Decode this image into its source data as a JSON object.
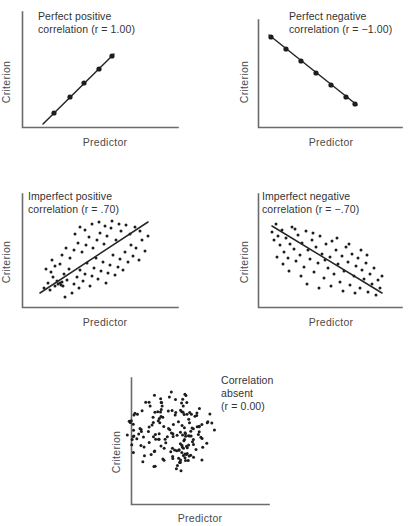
{
  "figure": {
    "background": "#ffffff",
    "ink_color": "#1d1d1d",
    "axis_color": "#6b6b6b",
    "width": 410,
    "height": 526
  },
  "chart_data": {
    "type": "scatter",
    "title": "",
    "panel_count": 5,
    "shared_axis_labels": {
      "xlabel": "Predictor",
      "ylabel": "Criterion"
    },
    "panels": [
      {
        "id": "perfect-positive",
        "caption": "Perfect positive\ncorrelation (r = 1.00)",
        "caption_line1": "Perfect positive",
        "caption_line2": "correlation (r = 1.00)",
        "r": 1.0,
        "xlabel": "Predictor",
        "ylabel": "Criterion",
        "series_type": "line-with-markers",
        "line": {
          "x1": 21,
          "y1": 97,
          "x2": 92,
          "y2": 27
        },
        "points": [
          {
            "x": 32,
            "y": 86
          },
          {
            "x": 48,
            "y": 70
          },
          {
            "x": 62,
            "y": 56
          },
          {
            "x": 77,
            "y": 42
          },
          {
            "x": 90,
            "y": 29
          }
        ]
      },
      {
        "id": "perfect-negative",
        "caption": "Perfect negative\ncorrelation (r = −1.00)",
        "caption_line1": "Perfect negative",
        "caption_line2": "correlation (r = −1.00)",
        "r": -1.0,
        "xlabel": "Predictor",
        "ylabel": "Criterion",
        "series_type": "line-with-markers",
        "line": {
          "x1": 16,
          "y1": 26,
          "x2": 104,
          "y2": 96
        },
        "points": [
          {
            "x": 27,
            "y": 35
          },
          {
            "x": 42,
            "y": 47
          },
          {
            "x": 57,
            "y": 59
          },
          {
            "x": 72,
            "y": 71
          },
          {
            "x": 87,
            "y": 83
          },
          {
            "x": 101,
            "y": 94
          }
        ]
      },
      {
        "id": "imperfect-positive",
        "caption": "Imperfect positive\ncorrelation (r = .70)",
        "caption_line1": "Imperfect positive",
        "caption_line2": "correlation (r =  .70)",
        "r": 0.7,
        "xlabel": "Predictor",
        "ylabel": "Criterion",
        "series_type": "scatter-with-fit",
        "line": {
          "x1": 18,
          "y1": 93,
          "x2": 126,
          "y2": 22
        },
        "points": [
          {
            "x": 22,
            "y": 88
          },
          {
            "x": 26,
            "y": 83
          },
          {
            "x": 28,
            "y": 90
          },
          {
            "x": 31,
            "y": 77
          },
          {
            "x": 33,
            "y": 86
          },
          {
            "x": 35,
            "y": 81
          },
          {
            "x": 36,
            "y": 84
          },
          {
            "x": 38,
            "y": 83
          },
          {
            "x": 39,
            "y": 85
          },
          {
            "x": 40,
            "y": 82
          },
          {
            "x": 41,
            "y": 86
          },
          {
            "x": 43,
            "y": 97
          },
          {
            "x": 24,
            "y": 69
          },
          {
            "x": 29,
            "y": 72
          },
          {
            "x": 33,
            "y": 66
          },
          {
            "x": 30,
            "y": 60
          },
          {
            "x": 38,
            "y": 64
          },
          {
            "x": 42,
            "y": 74
          },
          {
            "x": 45,
            "y": 80
          },
          {
            "x": 47,
            "y": 69
          },
          {
            "x": 50,
            "y": 93
          },
          {
            "x": 52,
            "y": 84
          },
          {
            "x": 55,
            "y": 77
          },
          {
            "x": 57,
            "y": 88
          },
          {
            "x": 58,
            "y": 70
          },
          {
            "x": 61,
            "y": 81
          },
          {
            "x": 63,
            "y": 74
          },
          {
            "x": 65,
            "y": 63
          },
          {
            "x": 68,
            "y": 86
          },
          {
            "x": 70,
            "y": 76
          },
          {
            "x": 72,
            "y": 68
          },
          {
            "x": 74,
            "y": 58
          },
          {
            "x": 76,
            "y": 79
          },
          {
            "x": 79,
            "y": 71
          },
          {
            "x": 81,
            "y": 62
          },
          {
            "x": 84,
            "y": 83
          },
          {
            "x": 86,
            "y": 73
          },
          {
            "x": 88,
            "y": 65
          },
          {
            "x": 91,
            "y": 55
          },
          {
            "x": 93,
            "y": 75
          },
          {
            "x": 96,
            "y": 67
          },
          {
            "x": 98,
            "y": 59
          },
          {
            "x": 101,
            "y": 70
          },
          {
            "x": 103,
            "y": 52
          },
          {
            "x": 106,
            "y": 62
          },
          {
            "x": 109,
            "y": 45
          },
          {
            "x": 111,
            "y": 56
          },
          {
            "x": 114,
            "y": 48
          },
          {
            "x": 117,
            "y": 60
          },
          {
            "x": 120,
            "y": 40
          },
          {
            "x": 123,
            "y": 51
          },
          {
            "x": 126,
            "y": 36
          },
          {
            "x": 40,
            "y": 55
          },
          {
            "x": 44,
            "y": 48
          },
          {
            "x": 48,
            "y": 58
          },
          {
            "x": 52,
            "y": 50
          },
          {
            "x": 56,
            "y": 43
          },
          {
            "x": 60,
            "y": 52
          },
          {
            "x": 64,
            "y": 45
          },
          {
            "x": 67,
            "y": 37
          },
          {
            "x": 71,
            "y": 48
          },
          {
            "x": 75,
            "y": 40
          },
          {
            "x": 78,
            "y": 33
          },
          {
            "x": 82,
            "y": 44
          },
          {
            "x": 85,
            "y": 36
          },
          {
            "x": 89,
            "y": 28
          },
          {
            "x": 94,
            "y": 40
          },
          {
            "x": 99,
            "y": 31
          },
          {
            "x": 104,
            "y": 25
          },
          {
            "x": 108,
            "y": 34
          },
          {
            "x": 113,
            "y": 27
          },
          {
            "x": 118,
            "y": 31
          },
          {
            "x": 53,
            "y": 34
          },
          {
            "x": 58,
            "y": 27
          },
          {
            "x": 63,
            "y": 30
          },
          {
            "x": 70,
            "y": 24
          },
          {
            "x": 77,
            "y": 22
          },
          {
            "x": 83,
            "y": 26
          },
          {
            "x": 90,
            "y": 21
          },
          {
            "x": 97,
            "y": 24
          }
        ]
      },
      {
        "id": "imperfect-negative",
        "caption": "Imperfect negative\ncorrelation (r = −.70)",
        "caption_line1": "Imperfect negative",
        "caption_line2": "correlation (r =  − .70)",
        "r": -0.7,
        "xlabel": "Predictor",
        "ylabel": "Criterion",
        "series_type": "scatter-with-fit",
        "line": {
          "x1": 14,
          "y1": 26,
          "x2": 124,
          "y2": 93
        },
        "points": [
          {
            "x": 16,
            "y": 32
          },
          {
            "x": 18,
            "y": 40
          },
          {
            "x": 20,
            "y": 24
          },
          {
            "x": 22,
            "y": 36
          },
          {
            "x": 24,
            "y": 45
          },
          {
            "x": 26,
            "y": 30
          },
          {
            "x": 28,
            "y": 52
          },
          {
            "x": 30,
            "y": 38
          },
          {
            "x": 32,
            "y": 58
          },
          {
            "x": 34,
            "y": 44
          },
          {
            "x": 36,
            "y": 27
          },
          {
            "x": 38,
            "y": 49
          },
          {
            "x": 40,
            "y": 61
          },
          {
            "x": 42,
            "y": 35
          },
          {
            "x": 44,
            "y": 55
          },
          {
            "x": 46,
            "y": 43
          },
          {
            "x": 48,
            "y": 67
          },
          {
            "x": 50,
            "y": 31
          },
          {
            "x": 52,
            "y": 50
          },
          {
            "x": 54,
            "y": 59
          },
          {
            "x": 56,
            "y": 40
          },
          {
            "x": 58,
            "y": 72
          },
          {
            "x": 60,
            "y": 47
          },
          {
            "x": 62,
            "y": 63
          },
          {
            "x": 64,
            "y": 36
          },
          {
            "x": 66,
            "y": 54
          },
          {
            "x": 68,
            "y": 78
          },
          {
            "x": 70,
            "y": 44
          },
          {
            "x": 72,
            "y": 68
          },
          {
            "x": 74,
            "y": 57
          },
          {
            "x": 76,
            "y": 41
          },
          {
            "x": 78,
            "y": 74
          },
          {
            "x": 80,
            "y": 50
          },
          {
            "x": 82,
            "y": 64
          },
          {
            "x": 84,
            "y": 82
          },
          {
            "x": 86,
            "y": 56
          },
          {
            "x": 88,
            "y": 71
          },
          {
            "x": 90,
            "y": 47
          },
          {
            "x": 92,
            "y": 62
          },
          {
            "x": 94,
            "y": 85
          },
          {
            "x": 96,
            "y": 54
          },
          {
            "x": 98,
            "y": 76
          },
          {
            "x": 100,
            "y": 66
          },
          {
            "x": 102,
            "y": 58
          },
          {
            "x": 104,
            "y": 88
          },
          {
            "x": 106,
            "y": 70
          },
          {
            "x": 108,
            "y": 79
          },
          {
            "x": 110,
            "y": 63
          },
          {
            "x": 112,
            "y": 92
          },
          {
            "x": 114,
            "y": 74
          },
          {
            "x": 116,
            "y": 84
          },
          {
            "x": 118,
            "y": 68
          },
          {
            "x": 120,
            "y": 95
          },
          {
            "x": 122,
            "y": 80
          },
          {
            "x": 124,
            "y": 88
          },
          {
            "x": 126,
            "y": 76
          },
          {
            "x": 21,
            "y": 57
          },
          {
            "x": 27,
            "y": 64
          },
          {
            "x": 33,
            "y": 71
          },
          {
            "x": 39,
            "y": 29
          },
          {
            "x": 45,
            "y": 76
          },
          {
            "x": 51,
            "y": 84
          },
          {
            "x": 57,
            "y": 33
          },
          {
            "x": 63,
            "y": 88
          },
          {
            "x": 69,
            "y": 60
          },
          {
            "x": 75,
            "y": 86
          },
          {
            "x": 81,
            "y": 38
          },
          {
            "x": 87,
            "y": 91
          },
          {
            "x": 93,
            "y": 44
          },
          {
            "x": 99,
            "y": 93
          },
          {
            "x": 105,
            "y": 50
          },
          {
            "x": 111,
            "y": 55
          }
        ]
      },
      {
        "id": "correlation-absent",
        "caption": "Correlation\nabsent\n(r = 0.00)",
        "caption_line1": "Correlation",
        "caption_line2": "absent",
        "caption_line3": "(r = 0.00)",
        "r": 0.0,
        "xlabel": "Predictor",
        "ylabel": "Criterion",
        "series_type": "scatter-cloud",
        "cloud": {
          "cx": 62,
          "cy": 60,
          "rx": 44,
          "ry": 40,
          "n": 170
        }
      }
    ]
  },
  "labels": {
    "predictor": "Predictor",
    "criterion": "Criterion"
  }
}
